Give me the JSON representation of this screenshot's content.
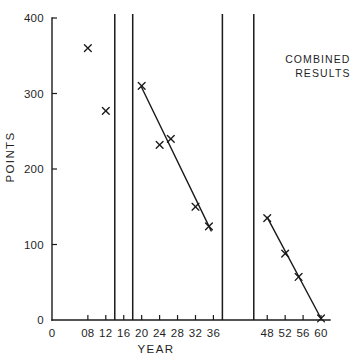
{
  "chart_data": {
    "type": "scatter",
    "title": "",
    "xlabel": "YEAR",
    "ylabel": "POINTS",
    "xlim": [
      0,
      62
    ],
    "ylim": [
      0,
      400
    ],
    "grid": false,
    "legend": null,
    "x_tick_labels": [
      "0",
      "08",
      "12",
      "16",
      "20",
      "24",
      "28",
      "32",
      "36",
      "48",
      "52",
      "56",
      "60"
    ],
    "x_tick_values": [
      0,
      8,
      12,
      16,
      20,
      24,
      28,
      32,
      36,
      48,
      52,
      56,
      60
    ],
    "y_tick_labels": [
      "0",
      "100",
      "200",
      "300",
      "400"
    ],
    "y_tick_values": [
      0,
      100,
      200,
      300,
      400
    ],
    "annotations": [
      {
        "name": "combined-results-label",
        "line1": "COMBINED",
        "line2": "RESULTS",
        "x": 52,
        "y": 340
      }
    ],
    "vertical_lines": [
      {
        "name": "war-band-start-1",
        "x": 14
      },
      {
        "name": "war-band-end-1",
        "x": 18
      },
      {
        "name": "war-band-start-2",
        "x": 38
      },
      {
        "name": "war-band-end-2",
        "x": 45
      }
    ],
    "series": [
      {
        "name": "Early points",
        "marker": "x",
        "points": [
          {
            "x": 8,
            "y": 360
          },
          {
            "x": 12,
            "y": 277
          }
        ]
      },
      {
        "name": "Interwar points",
        "marker": "x",
        "points": [
          {
            "x": 20,
            "y": 310
          },
          {
            "x": 24,
            "y": 232
          },
          {
            "x": 26.5,
            "y": 240
          },
          {
            "x": 32,
            "y": 150
          },
          {
            "x": 35,
            "y": 124
          }
        ]
      },
      {
        "name": "Postwar points",
        "marker": "x",
        "points": [
          {
            "x": 48,
            "y": 135
          },
          {
            "x": 52,
            "y": 88
          },
          {
            "x": 55,
            "y": 57
          },
          {
            "x": 60,
            "y": 2
          }
        ]
      }
    ],
    "trend_lines": [
      {
        "name": "interwar-trend",
        "x1": 20,
        "y1": 308,
        "x2": 35.5,
        "y2": 118
      },
      {
        "name": "postwar-trend",
        "x1": 48,
        "y1": 136,
        "x2": 60,
        "y2": 2
      }
    ]
  }
}
